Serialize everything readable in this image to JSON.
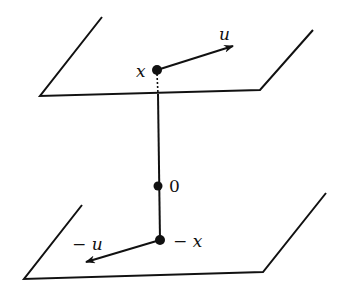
{
  "diagram": {
    "labels": {
      "x": "x",
      "u": "u",
      "origin": "0",
      "neg_x": "− x",
      "neg_u": "− u"
    },
    "colors": {
      "ink": "#111111",
      "background": "#ffffff"
    }
  }
}
